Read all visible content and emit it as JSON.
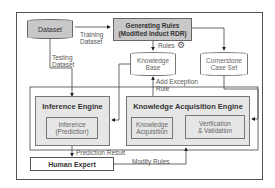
{
  "diagram": {
    "nodes": {
      "dataset": "Dataset",
      "generating_rules_line1": "Generating Rules",
      "generating_rules_line2": "(Modified Induct RDR)",
      "knowledge_base_line1": "Knowledge",
      "knowledge_base_line2": "Base",
      "cornerstone_line1": "Cornerstone",
      "cornerstone_line2": "Case Set",
      "inference_engine": "Inference Engine",
      "inference_line1": "Inference",
      "inference_line2": "(Prediction)",
      "kae": "Knowledge Acquisition Engine",
      "ka_line1": "Knowledge",
      "ka_line2": "Acquisition",
      "vv_line1": "Verification",
      "vv_line2": "& Validation",
      "human_expert": "Human Expert"
    },
    "edges": {
      "training_line1": "Training",
      "training_line2": "Dataset",
      "testing_line1": "Testing",
      "testing_line2": "Dataset",
      "rules": "Rules",
      "add_exception_line1": "Add Exception",
      "add_exception_line2": "Rule",
      "prediction_result": "Prediction Result",
      "modify_rules": "Modify Rules"
    },
    "icons": {
      "rules_icon": "gears-icon"
    },
    "colors": {
      "dark_fill": "#c8c8c8",
      "light_fill": "#e6e6e6",
      "line": "#333333"
    }
  }
}
